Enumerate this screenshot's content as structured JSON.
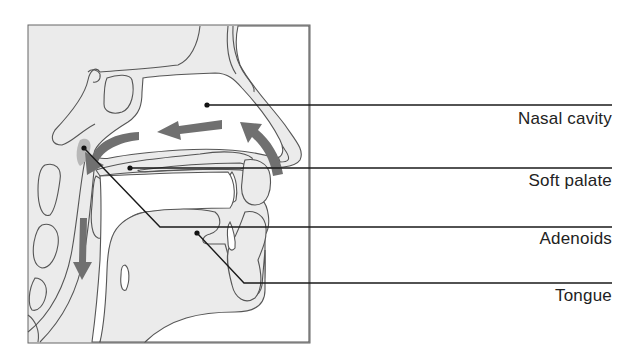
{
  "figure": {
    "colors": {
      "background": "#ffffff",
      "tissue_fill": "#ebebeb",
      "outline": "#555555",
      "leader_line": "#1a1a1a",
      "airflow_arrow": "#707070",
      "adenoid_highlight": "#b8b8b8",
      "label_text": "#222222"
    }
  },
  "labels": [
    {
      "id": "nasal-cavity",
      "text": "Nasal cavity"
    },
    {
      "id": "soft-palate",
      "text": "Soft palate"
    },
    {
      "id": "adenoids",
      "text": "Adenoids"
    },
    {
      "id": "tongue",
      "text": "Tongue"
    }
  ],
  "arrows": [
    {
      "id": "airflow-nostril-up",
      "direction": "curved-up-left"
    },
    {
      "id": "airflow-nasal-back",
      "direction": "left"
    },
    {
      "id": "airflow-nasopharynx-down",
      "direction": "curved-down"
    },
    {
      "id": "airflow-pharynx-down",
      "direction": "down"
    }
  ]
}
